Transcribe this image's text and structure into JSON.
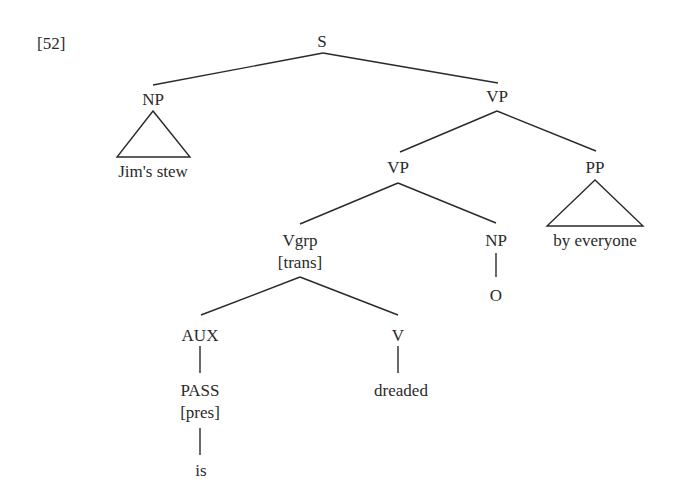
{
  "example_number": "[52]",
  "tree": {
    "S": "S",
    "NP_subject": "NP",
    "NP_subject_text": "Jim's stew",
    "VP_top": "VP",
    "VP_inner": "VP",
    "PP": "PP",
    "PP_text": "by everyone",
    "Vgrp": "Vgrp",
    "Vgrp_feature": "[trans]",
    "NP_object": "NP",
    "NP_object_text": "O",
    "AUX": "AUX",
    "PASS": "PASS",
    "PASS_feature": "[pres]",
    "AUX_word": "is",
    "V": "V",
    "V_word": "dreaded"
  }
}
